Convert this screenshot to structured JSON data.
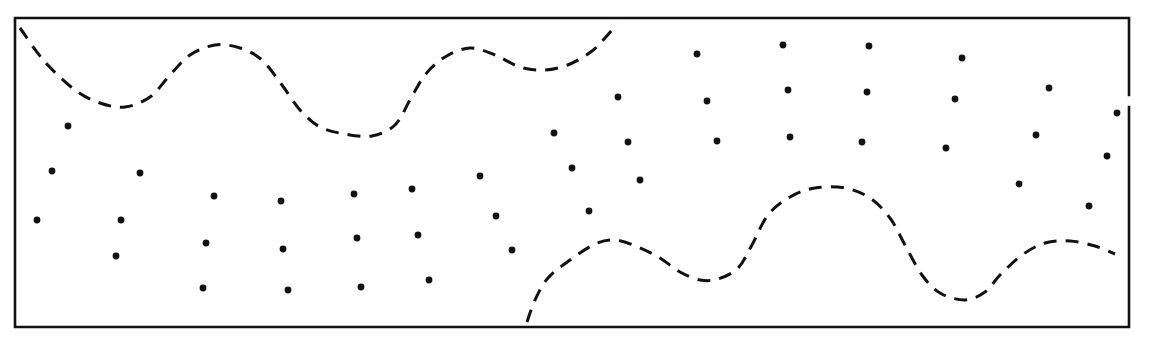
{
  "diagram": {
    "colors": {
      "ink": "#111111",
      "background": "#ffffff"
    },
    "frame": {
      "x1": 15,
      "y1": 18,
      "x2": 1129,
      "y2": 327,
      "right_gap": [
        95,
        107
      ]
    },
    "curves": [
      {
        "name": "upper-dashed-curve",
        "points": [
          [
            20,
            28
          ],
          [
            45,
            62
          ],
          [
            75,
            90
          ],
          [
            100,
            103
          ],
          [
            125,
            107
          ],
          [
            150,
            97
          ],
          [
            170,
            75
          ],
          [
            190,
            55
          ],
          [
            215,
            45
          ],
          [
            240,
            48
          ],
          [
            262,
            60
          ],
          [
            282,
            85
          ],
          [
            300,
            110
          ],
          [
            320,
            127
          ],
          [
            345,
            134
          ],
          [
            372,
            136
          ],
          [
            395,
            125
          ],
          [
            410,
            100
          ],
          [
            425,
            75
          ],
          [
            445,
            57
          ],
          [
            470,
            48
          ],
          [
            495,
            55
          ],
          [
            520,
            67
          ],
          [
            545,
            70
          ],
          [
            570,
            64
          ],
          [
            592,
            51
          ],
          [
            605,
            38
          ],
          [
            617,
            24
          ]
        ]
      },
      {
        "name": "lower-dashed-curve",
        "points": [
          [
            527,
            322
          ],
          [
            535,
            300
          ],
          [
            548,
            278
          ],
          [
            570,
            260
          ],
          [
            595,
            244
          ],
          [
            615,
            240
          ],
          [
            638,
            247
          ],
          [
            660,
            258
          ],
          [
            680,
            272
          ],
          [
            700,
            280
          ],
          [
            718,
            279
          ],
          [
            738,
            268
          ],
          [
            752,
            245
          ],
          [
            768,
            215
          ],
          [
            790,
            197
          ],
          [
            815,
            188
          ],
          [
            845,
            188
          ],
          [
            870,
            198
          ],
          [
            890,
            218
          ],
          [
            905,
            245
          ],
          [
            922,
            275
          ],
          [
            940,
            293
          ],
          [
            965,
            300
          ],
          [
            985,
            292
          ],
          [
            1000,
            275
          ],
          [
            1022,
            255
          ],
          [
            1045,
            243
          ],
          [
            1070,
            241
          ],
          [
            1095,
            246
          ],
          [
            1115,
            254
          ]
        ]
      }
    ],
    "dots": [
      [
        68,
        126
      ],
      [
        52,
        171
      ],
      [
        140,
        173
      ],
      [
        37,
        220
      ],
      [
        121,
        220
      ],
      [
        116,
        256
      ],
      [
        214,
        196
      ],
      [
        281,
        201
      ],
      [
        354,
        194
      ],
      [
        412,
        189
      ],
      [
        480,
        176
      ],
      [
        206,
        243
      ],
      [
        283,
        249
      ],
      [
        357,
        238
      ],
      [
        418,
        235
      ],
      [
        496,
        216
      ],
      [
        512,
        250
      ],
      [
        203,
        288
      ],
      [
        288,
        290
      ],
      [
        361,
        287
      ],
      [
        429,
        280
      ],
      [
        697,
        54
      ],
      [
        783,
        45
      ],
      [
        869,
        46
      ],
      [
        962,
        58
      ],
      [
        1049,
        88
      ],
      [
        618,
        97
      ],
      [
        707,
        101
      ],
      [
        788,
        90
      ],
      [
        867,
        92
      ],
      [
        955,
        99
      ],
      [
        554,
        133
      ],
      [
        628,
        142
      ],
      [
        717,
        141
      ],
      [
        790,
        137
      ],
      [
        862,
        142
      ],
      [
        946,
        148
      ],
      [
        1036,
        135
      ],
      [
        1117,
        113
      ],
      [
        572,
        168
      ],
      [
        640,
        180
      ],
      [
        1107,
        156
      ],
      [
        1019,
        184
      ],
      [
        589,
        211
      ],
      [
        1089,
        206
      ]
    ],
    "dot_radius": 3.4
  }
}
